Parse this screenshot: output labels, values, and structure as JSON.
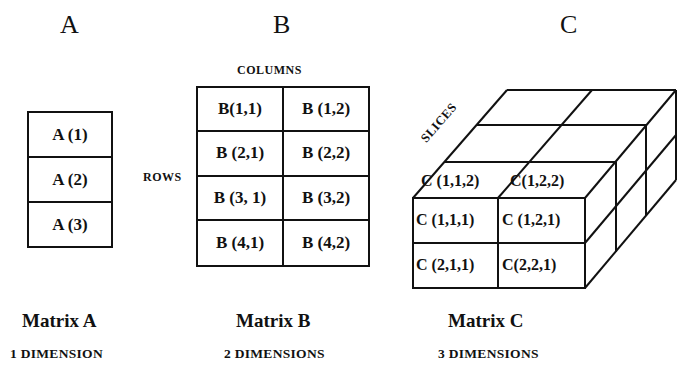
{
  "headings": {
    "a": "A",
    "b": "B",
    "c": "C"
  },
  "matrix_a": {
    "cells": [
      "A (1)",
      "A (2)",
      "A (3)"
    ],
    "title": "Matrix A",
    "dimension": "1 DIMENSION"
  },
  "matrix_b": {
    "columns_label": "COLUMNS",
    "rows_label": "ROWS",
    "cells": [
      [
        "B(1,1)",
        "B (1,2)"
      ],
      [
        "B (2,1)",
        "B (2,2)"
      ],
      [
        "B (3, 1)",
        "B (3,2)"
      ],
      [
        "B (4,1)",
        "B (4,2)"
      ]
    ],
    "title": "Matrix  B",
    "dimension": "2 DIMENSIONS"
  },
  "matrix_c": {
    "slices_label": "SLICES",
    "top_cells": [
      "C (1,1,2)",
      "C(1,2,2)"
    ],
    "front_cells": [
      [
        "C (1,1,1)",
        "C (1,2,1)"
      ],
      [
        "C (2,1,1)",
        "C(2,2,1)"
      ]
    ],
    "title": "Matrix C",
    "dimension": "3 DIMENSIONS"
  }
}
